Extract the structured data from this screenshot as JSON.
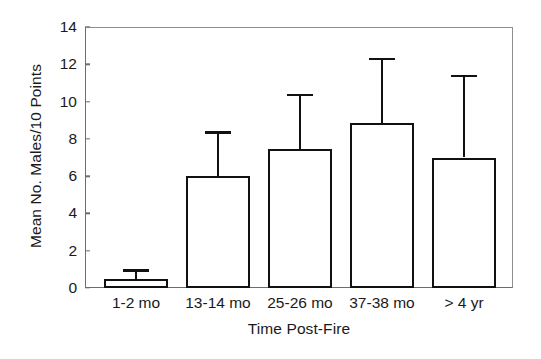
{
  "chart_data": {
    "type": "bar",
    "title": "",
    "subtitle": "",
    "xlabel": "Time Post-Fire",
    "ylabel": "Mean No. Males/10 Points",
    "categories": [
      "1-2 mo",
      "13-14 mo",
      "25-26 mo",
      "37-38 mo",
      "> 4 yr"
    ],
    "values": [
      0.5,
      6.0,
      7.45,
      8.85,
      7.0
    ],
    "error_upper": [
      1.0,
      8.4,
      10.4,
      12.35,
      11.45
    ],
    "error_type": "upper-only",
    "series": [
      {
        "name": "Mean No. Males/10 Points",
        "values": [
          0.5,
          6.0,
          7.45,
          8.85,
          7.0
        ],
        "error_upper": [
          1.0,
          8.4,
          10.4,
          12.35,
          11.45
        ]
      }
    ],
    "ylim": [
      0,
      14
    ],
    "yticks": [
      0,
      2,
      4,
      6,
      8,
      10,
      12,
      14
    ],
    "ytick_labels": [
      "0",
      "2",
      "4",
      "6",
      "8",
      "10",
      "12",
      "14"
    ],
    "grid": false,
    "legend": false,
    "legend_position": "none",
    "bar_fill": "#ffffff",
    "bar_edge": "#111111",
    "axis_color": "#6d6d6d",
    "text_color": "#1a1a1a",
    "background": "#ffffff",
    "annotations": []
  }
}
